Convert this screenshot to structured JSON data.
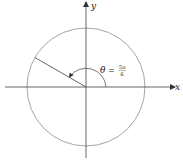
{
  "diagram": {
    "type": "unit-circle-angle",
    "axes": {
      "x_label": "x",
      "y_label": "y"
    },
    "angle": {
      "symbol": "θ",
      "equals": "=",
      "numerator": "5π",
      "denominator": "6",
      "degrees": 150
    },
    "colors": {
      "circle": "#9a9a9a",
      "axes": "#555555",
      "terminal_side": "#555555",
      "arc": "#555555"
    }
  }
}
